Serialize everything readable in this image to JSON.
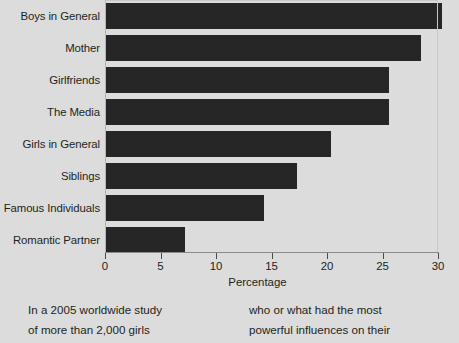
{
  "chart_data": {
    "type": "bar",
    "orientation": "horizontal",
    "title": "",
    "xlabel": "Percentage",
    "ylabel": "",
    "xlim": [
      0,
      30
    ],
    "xticks": [
      0,
      5,
      10,
      15,
      20,
      25,
      30
    ],
    "xtick_labels": [
      "0",
      "5",
      "10",
      "15",
      "20",
      "25",
      "30"
    ],
    "grid": false,
    "legend": null,
    "bar_color": "#262626",
    "background_color": "#dcdcdc",
    "categories": [
      "Boys in General",
      "Mother",
      "Girlfriends",
      "The Media",
      "Girls in General",
      "Siblings",
      "Famous Individuals",
      "Romantic Partner"
    ],
    "values": [
      30.4,
      28.5,
      25.6,
      25.6,
      20.4,
      17.3,
      14.3,
      7.2
    ]
  },
  "caption": {
    "left_lines": [
      "In a 2005 worldwide study",
      "of more than 2,000 girls"
    ],
    "right_lines": [
      "who or what had the most",
      "powerful influences on their"
    ]
  }
}
